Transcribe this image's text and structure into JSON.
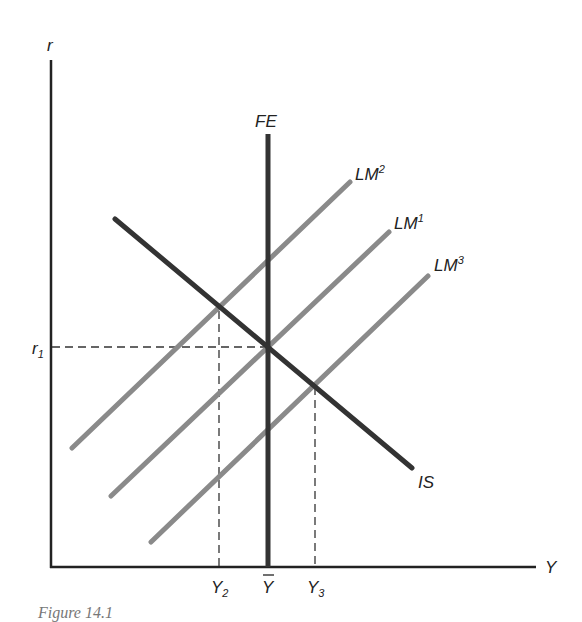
{
  "diagram": {
    "type": "IS-LM-FE diagram",
    "axes": {
      "y_axis_label": "r",
      "x_axis_label": "Y"
    },
    "curves": [
      {
        "id": "FE",
        "label": "FE",
        "superscript": "",
        "kind": "vertical",
        "color": "#333333"
      },
      {
        "id": "IS",
        "label": "IS",
        "superscript": "",
        "kind": "downward-sloping",
        "color": "#333333"
      },
      {
        "id": "LM2",
        "label": "LM",
        "superscript": "2",
        "kind": "upward-sloping",
        "color": "#8a8a8a"
      },
      {
        "id": "LM1",
        "label": "LM",
        "superscript": "1",
        "kind": "upward-sloping",
        "color": "#8a8a8a"
      },
      {
        "id": "LM3",
        "label": "LM",
        "superscript": "3",
        "kind": "upward-sloping",
        "color": "#8a8a8a"
      }
    ],
    "y_ticks": [
      {
        "label": "r",
        "subscript": "1"
      }
    ],
    "x_ticks": [
      {
        "label": "Y",
        "subscript": "2"
      },
      {
        "label": "Y",
        "overbar": true,
        "subscript": ""
      },
      {
        "label": "Y",
        "subscript": "3"
      }
    ],
    "caption": "Figure 14.1"
  }
}
